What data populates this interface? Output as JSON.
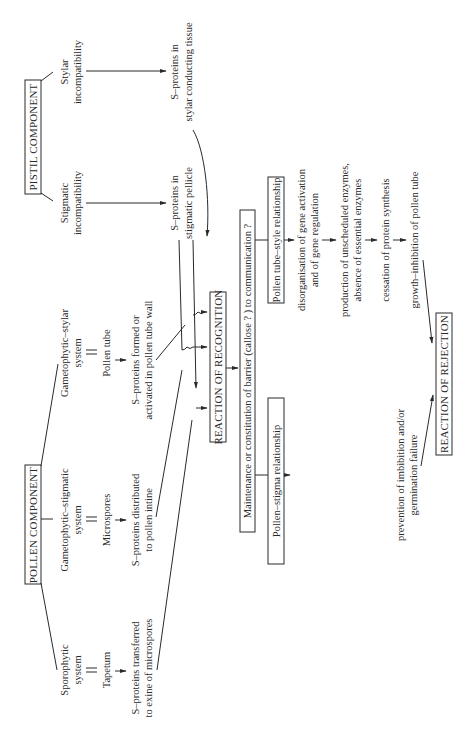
{
  "diagram": {
    "orientation": "rotated-90-ccw",
    "pistil": {
      "title": "PISTIL COMPONENT",
      "stigmatic": [
        "Stigmatic",
        "incompatibility"
      ],
      "stylar": [
        "Stylar",
        "incompatibility"
      ],
      "stigmatic_result": [
        "S–proteins in",
        "stigmatic pellicle"
      ],
      "stylar_result": [
        "S–proteins in",
        "stylar conducting tissue"
      ]
    },
    "pollen": {
      "title": "POLLEN COMPONENT",
      "sporophytic": {
        "system": [
          "Sporophytic",
          "system"
        ],
        "site": "Tapetum",
        "result": [
          "S–proteins transferred",
          "to exine of microspores"
        ]
      },
      "gametophytic_stigmatic": {
        "system": [
          "Gametophytic–stigmatic",
          "system"
        ],
        "site": "Microspores",
        "result": [
          "S–proteins distributed",
          "to pollen intine"
        ]
      },
      "gametophytic_stylar": {
        "system": [
          "Gametophytic–stylar",
          "system"
        ],
        "site": "Pollen tube",
        "result": [
          "S–proteins formed or",
          "activated in pollen tube wall"
        ]
      }
    },
    "recognition": "REACTION OF RECOGNITION",
    "barrier": "Maintenance or constitution of barrier (callose ? ) to communication ?",
    "pollen_stigma": {
      "title": "Pollen–stigma relationship",
      "effect": [
        "prevention of imbibition and/or",
        "germination failure"
      ]
    },
    "pollen_tube_style": {
      "title": "Pollen tube–style relationship",
      "steps": [
        [
          "disorganisation of gene activation",
          "and of gene regulation"
        ],
        [
          "production of unscheduled enzymes,",
          "absence of essential enzymes"
        ],
        [
          "cessation of protein synthesis"
        ],
        [
          "growth–inhibition of pollen tube"
        ]
      ]
    },
    "rejection": "REACTION OF REJECTION"
  }
}
